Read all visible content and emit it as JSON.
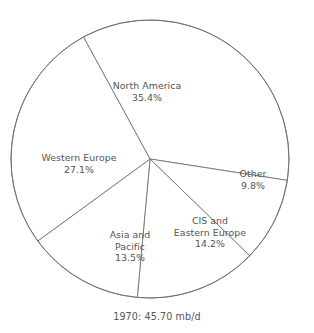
{
  "chart_data": {
    "type": "pie",
    "title": "",
    "caption": "1970: 45.70 mb/d",
    "legend_position": "none",
    "grid": false,
    "unit": "percent",
    "total_label": "1970: 45.70 mb/d",
    "year": "1970",
    "total_value": "45.70 mb/d",
    "categories": [
      "North America",
      "Other",
      "CIS and Eastern Europe",
      "Asia and Pacific",
      "Western Europe"
    ],
    "values": [
      35.4,
      9.8,
      14.2,
      13.5,
      27.1
    ],
    "value_labels": [
      "35.4%",
      "9.8%",
      "14.2%",
      "13.5%",
      "27.1%"
    ],
    "start_angle_deg": -28.6,
    "slices": [
      {
        "name": "North America",
        "name_line1": "North America",
        "name_line2": "",
        "value": 35.4,
        "value_label": "35.4%",
        "color": "#ffffff",
        "stroke": "#6e6e6e"
      },
      {
        "name": "Other",
        "name_line1": "Other",
        "name_line2": "",
        "value": 9.8,
        "value_label": "9.8%",
        "color": "#ffffff",
        "stroke": "#6e6e6e"
      },
      {
        "name": "CIS and Eastern Europe",
        "name_line1": "CIS and",
        "name_line2": "Eastern Europe",
        "value": 14.2,
        "value_label": "14.2%",
        "color": "#ffffff",
        "stroke": "#6e6e6e"
      },
      {
        "name": "Asia and Pacific",
        "name_line1": "Asia and",
        "name_line2": "Pacific",
        "value": 13.5,
        "value_label": "13.5%",
        "color": "#ffffff",
        "stroke": "#6e6e6e"
      },
      {
        "name": "Western Europe",
        "name_line1": "Western Europe",
        "name_line2": "",
        "value": 27.1,
        "value_label": "27.1%",
        "color": "#ffffff",
        "stroke": "#6e6e6e"
      }
    ]
  },
  "style": {
    "background": "#ffffff",
    "line_color": "#6e6e6e",
    "text_color": "#555555"
  },
  "geometry": {
    "center_x": 150,
    "center_y": 159,
    "radius": 139
  }
}
